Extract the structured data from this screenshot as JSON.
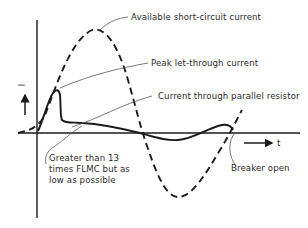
{
  "diagram": {
    "type": "circuit-breaker-current-waveform",
    "axes": {
      "y_label": "I",
      "x_label": "t"
    },
    "curves": [
      {
        "id": "available-short-circuit",
        "style": "dashed",
        "label": "Available short-circuit current"
      },
      {
        "id": "peak-let-through",
        "style": "solid",
        "label": "Peak let-through current"
      },
      {
        "id": "parallel-resistor",
        "style": "solid",
        "label": "Current through parallel resistor"
      }
    ],
    "annotations": {
      "available": "Available short-circuit current",
      "peak": "Peak let-through current",
      "parallel": "Current through parallel resistor",
      "greater_line1": "Greater than 13",
      "greater_line2": "times FLMC but as",
      "greater_line3": "low as possible",
      "breaker": "Breaker open"
    },
    "colors": {
      "ink": "#1a1a1a",
      "text": "#2a2a2a",
      "leader": "#555555",
      "background": "#ffffff"
    }
  }
}
